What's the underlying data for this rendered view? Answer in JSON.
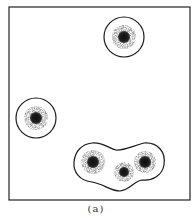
{
  "figure": {
    "caption": "(a)",
    "frame": {
      "x": 9,
      "y": 7,
      "width": 181,
      "height": 193
    },
    "colors": {
      "outline": "#1a1a1a",
      "core": "#151515",
      "halo": "#8a8a8a",
      "background": "#ffffff"
    },
    "isolated_particles": [
      {
        "cx": 124,
        "cy": 37,
        "boundary_r": 20,
        "halo_r": 12,
        "core_r": 6
      },
      {
        "cx": 36,
        "cy": 118,
        "boundary_r": 20,
        "halo_r": 12,
        "core_r": 6
      }
    ],
    "merged_group": {
      "particles": [
        {
          "cx": 93,
          "cy": 162,
          "halo_r": 12,
          "core_r": 6
        },
        {
          "cx": 124,
          "cy": 172,
          "halo_r": 10,
          "core_r": 5
        },
        {
          "cx": 145,
          "cy": 162,
          "halo_r": 11,
          "core_r": 6
        }
      ]
    }
  }
}
